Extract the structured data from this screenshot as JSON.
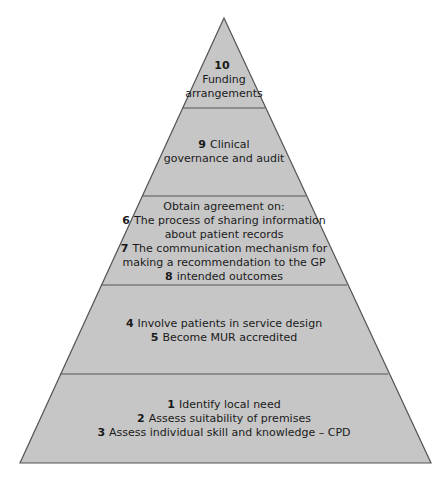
{
  "diagram": {
    "type": "pyramid",
    "colors": {
      "fill": "#c6c6c6",
      "outline": "#555555",
      "text": "#1a1a1a"
    },
    "levels": [
      {
        "id": "top",
        "lines": [
          {
            "num": "10",
            "text": ""
          },
          {
            "num": "",
            "text": "Funding"
          },
          {
            "num": "",
            "text": "arrangements"
          }
        ]
      },
      {
        "id": "level-2",
        "lines": [
          {
            "num": "9",
            "text": "Clinical"
          },
          {
            "num": "",
            "text": "governance and audit"
          }
        ]
      },
      {
        "id": "level-3",
        "lines": [
          {
            "num": "",
            "text": "Obtain agreement on:"
          },
          {
            "num": "6",
            "text": "The process of sharing information"
          },
          {
            "num": "",
            "text": "about patient records"
          },
          {
            "num": "7",
            "text": "The communication mechanism for"
          },
          {
            "num": "",
            "text": "making a recommendation to the GP"
          },
          {
            "num": "8",
            "text": "intended outcomes"
          }
        ]
      },
      {
        "id": "level-4",
        "lines": [
          {
            "num": "4",
            "text": "Involve patients in service design"
          },
          {
            "num": "5",
            "text": "Become MUR accredited"
          }
        ]
      },
      {
        "id": "base",
        "lines": [
          {
            "num": "1",
            "text": "Identify local need"
          },
          {
            "num": "2",
            "text": "Assess suitability of premises"
          },
          {
            "num": "3",
            "text": "Assess individual skill and knowledge – CPD"
          }
        ]
      }
    ]
  }
}
